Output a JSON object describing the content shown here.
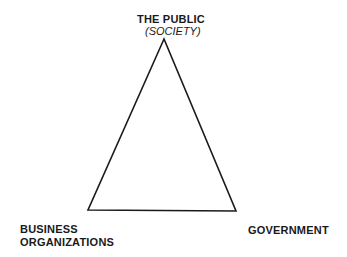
{
  "diagram": {
    "type": "triangle",
    "vertices": {
      "top": {
        "title": "THE PUBLIC",
        "subtitle": "(SOCIETY)"
      },
      "bottom_left": {
        "title_line1": "BUSINESS",
        "title_line2": "ORGANIZATIONS"
      },
      "bottom_right": {
        "title": "GOVERNMENT"
      }
    },
    "stroke_color": "#1a1a1a",
    "background": "#ffffff"
  }
}
